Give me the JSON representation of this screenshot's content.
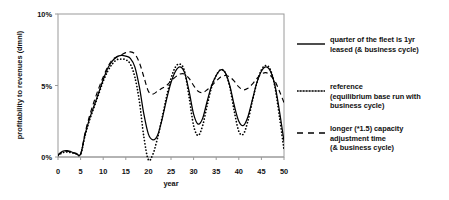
{
  "chart_data": {
    "type": "line",
    "title": "",
    "xlabel": "year",
    "ylabel": "profitability to revenues (dmnl)",
    "xlim": [
      0,
      50
    ],
    "ylim": [
      0,
      10
    ],
    "grid": false,
    "legend_position": "right",
    "xticks": [
      "0",
      "5",
      "10",
      "15",
      "20",
      "25",
      "30",
      "35",
      "40",
      "45",
      "50"
    ],
    "yticks": [
      "0%",
      "5%",
      "10%"
    ],
    "x": [
      0,
      1,
      2,
      3,
      4,
      5,
      6,
      7,
      8,
      9,
      10,
      11,
      12,
      13,
      14,
      15,
      16,
      17,
      18,
      19,
      20,
      21,
      22,
      23,
      24,
      25,
      26,
      27,
      28,
      29,
      30,
      31,
      32,
      33,
      34,
      35,
      36,
      37,
      38,
      39,
      40,
      41,
      42,
      43,
      44,
      45,
      46,
      47,
      48,
      49,
      50
    ],
    "series": [
      {
        "name": "quarter of the fleet is 1yr leased (& business cycle)",
        "style": "solid",
        "values": [
          0.15,
          0.4,
          0.45,
          0.35,
          0.25,
          0.2,
          1.6,
          2.7,
          3.6,
          4.5,
          5.4,
          6.2,
          6.7,
          7.0,
          7.1,
          7.05,
          6.9,
          6.3,
          4.9,
          3.0,
          1.6,
          1.2,
          1.5,
          2.6,
          4.0,
          5.2,
          6.0,
          6.3,
          5.9,
          4.6,
          3.0,
          2.3,
          2.7,
          3.9,
          5.0,
          5.7,
          6.1,
          5.9,
          5.0,
          3.6,
          2.5,
          2.2,
          2.8,
          4.0,
          5.2,
          6.0,
          6.3,
          6.0,
          5.0,
          3.2,
          1.1
        ]
      },
      {
        "name": "reference (equilibrium base run with business cycle)",
        "style": "dotted",
        "values": [
          0.1,
          0.3,
          0.35,
          0.3,
          0.22,
          0.18,
          1.5,
          2.6,
          3.5,
          4.4,
          5.3,
          6.0,
          6.5,
          6.8,
          6.85,
          6.8,
          6.5,
          5.6,
          3.9,
          1.4,
          -0.2,
          0.2,
          1.3,
          2.7,
          4.2,
          5.5,
          6.3,
          6.5,
          6.0,
          4.2,
          2.2,
          1.5,
          2.2,
          3.6,
          4.9,
          5.7,
          6.1,
          5.9,
          4.9,
          3.2,
          1.8,
          1.6,
          2.5,
          3.9,
          5.2,
          6.1,
          6.4,
          6.1,
          4.9,
          2.8,
          0.5
        ]
      },
      {
        "name": "longer (*1.5) capacity adjustment time (& business cycle)",
        "style": "dashed",
        "values": [
          0.12,
          0.35,
          0.4,
          0.33,
          0.24,
          0.2,
          1.7,
          2.9,
          3.9,
          4.8,
          5.6,
          6.3,
          6.8,
          7.0,
          7.15,
          7.3,
          7.35,
          7.2,
          6.6,
          5.6,
          4.6,
          4.4,
          4.6,
          4.8,
          5.0,
          5.3,
          5.6,
          5.8,
          5.8,
          5.5,
          5.0,
          4.6,
          4.5,
          4.7,
          5.0,
          5.3,
          5.6,
          5.7,
          5.6,
          5.3,
          4.9,
          4.7,
          4.8,
          5.1,
          5.5,
          5.8,
          5.9,
          5.7,
          5.3,
          4.6,
          3.8
        ]
      }
    ]
  },
  "axes": {
    "ylabel": "profitability to revenues (dmnl)",
    "xlabel": "year",
    "yticks": [
      "10%",
      "5%",
      "0%"
    ],
    "xticks": [
      "0",
      "5",
      "10",
      "15",
      "20",
      "25",
      "30",
      "35",
      "40",
      "45",
      "50"
    ]
  },
  "legend": {
    "items": [
      {
        "style": "solid",
        "lines": [
          "quarter of the fleet is 1yr",
          "leased (& business cycle)"
        ]
      },
      {
        "style": "dotted",
        "lines": [
          "reference",
          "(equilibrium base run with",
          "business cycle)"
        ]
      },
      {
        "style": "dashed",
        "lines": [
          "longer (*1.5) capacity",
          "adjustment time",
          "(& business cycle)"
        ]
      }
    ]
  },
  "colors": {
    "line": "#000000",
    "frame": "#9a9a9a",
    "text": "#111111",
    "background": "#ffffff"
  }
}
